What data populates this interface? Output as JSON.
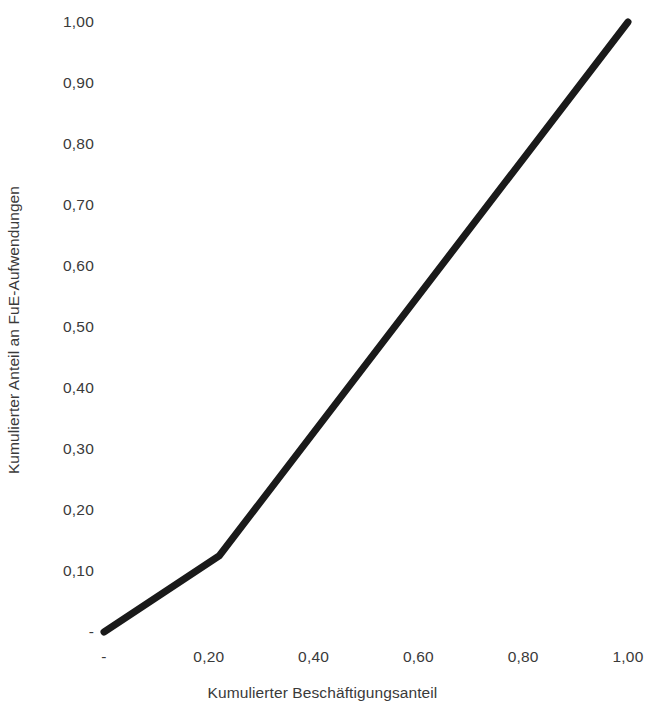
{
  "chart_data": {
    "type": "line",
    "title": "",
    "subtitle": "",
    "xlabel": "Kumulierter Beschäftigungsanteil",
    "ylabel": "Kumulierter Anteil an FuE-Aufwendungen",
    "xlim": [
      0,
      1
    ],
    "ylim": [
      0,
      1
    ],
    "grid": false,
    "legend": false,
    "legend_position": "none",
    "line_color": "#1a1a1a",
    "line_width_px": 7,
    "x_tick_values": [
      0,
      0.2,
      0.4,
      0.6,
      0.8,
      1.0
    ],
    "x_tick_labels": [
      "-",
      "0,20",
      "0,40",
      "0,60",
      "0,80",
      "1,00"
    ],
    "y_tick_values": [
      0,
      0.1,
      0.2,
      0.3,
      0.4,
      0.5,
      0.6,
      0.7,
      0.8,
      0.9,
      1.0
    ],
    "y_tick_labels": [
      "-",
      "0,10",
      "0,20",
      "0,30",
      "0,40",
      "0,50",
      "0,60",
      "0,70",
      "0,80",
      "0,90",
      "1,00"
    ],
    "series": [
      {
        "name": "Lorenzkurve",
        "x": [
          0.0,
          0.22,
          1.0
        ],
        "y": [
          0.0,
          0.125,
          1.0
        ]
      }
    ],
    "annotations": []
  },
  "axes": {
    "y_title": "Kumulierter Anteil an FuE-Aufwendungen",
    "x_title": "Kumulierter Beschäftigungsanteil"
  }
}
